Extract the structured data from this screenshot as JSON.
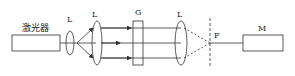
{
  "diagram": {
    "laser_label": "激光器",
    "lens_label_1": "L",
    "lens_label_2": "L",
    "grating_label": "G",
    "lens_label_3": "L",
    "focus_label": "F",
    "detector_label": "M"
  },
  "colors": {
    "stroke": "#333333",
    "background": "#ffffff"
  }
}
